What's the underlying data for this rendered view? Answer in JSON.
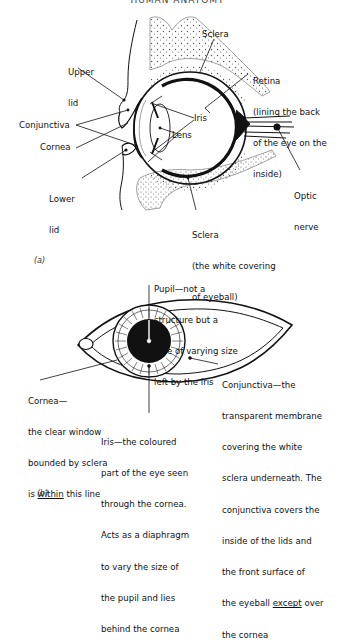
{
  "page": {
    "running_header": "HUMAN ANATOMY"
  },
  "figure_a": {
    "label": "(a)",
    "labels": {
      "upper_lid": [
        "Upper",
        "lid"
      ],
      "sclera_top": "Sclera",
      "retina": [
        "Retina",
        "(lining the back",
        "of the eye on the",
        "inside)"
      ],
      "iris": "Iris",
      "lens": "Lens",
      "conjunctiva": "Conjunctiva",
      "cornea": "Cornea",
      "lower_lid": [
        "Lower",
        "lid"
      ],
      "optic_nerve": [
        "Optic",
        "nerve"
      ],
      "sclera_bottom": [
        "Sclera",
        "(the white covering",
        "of eyeball)"
      ]
    }
  },
  "figure_b": {
    "label": "(b)",
    "labels": {
      "pupil": [
        "Pupil—not a",
        "structure but a",
        "hole of varying size",
        "left by the iris"
      ],
      "cornea": {
        "lines": [
          "Cornea—",
          "the clear window",
          "bounded by sclera"
        ],
        "last_line_prefix": "is ",
        "last_line_emphasis": "within",
        "last_line_suffix": " this line"
      },
      "conjunctiva": {
        "lines": [
          "Conjunctiva—the",
          "transparent membrane",
          "covering the white",
          "sclera underneath. The",
          "conjunctiva covers the",
          "inside of the lids and",
          "the front surface of"
        ],
        "line8_prefix": "the eyeball ",
        "line8_emphasis": "except",
        "line8_suffix": " over",
        "line9": "the cornea"
      },
      "iris": [
        "Iris—the coloured",
        "part of the eye seen",
        "through the cornea.",
        "Acts as a diaphragm",
        "to vary the size of",
        "the pupil and lies",
        "behind the cornea"
      ]
    }
  },
  "colors": {
    "ink": "#111111",
    "stipple": "#555555",
    "paper": "#ffffff"
  }
}
